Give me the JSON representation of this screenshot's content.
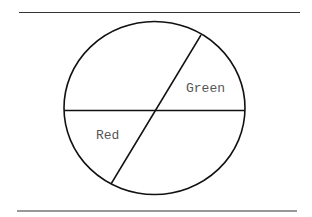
{
  "diagram": {
    "type": "circle-divided",
    "labels": {
      "green": "Green",
      "red": "Red"
    },
    "colors": {
      "stroke": "#111111",
      "rule": "#333333",
      "label_text": "#555555",
      "background": "#ffffff"
    }
  }
}
